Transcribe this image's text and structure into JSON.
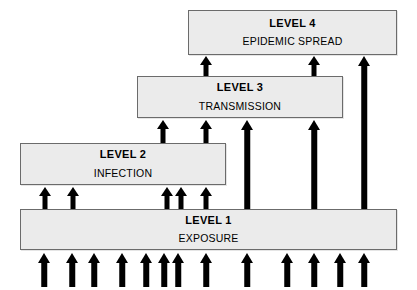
{
  "diagram": {
    "background_color": "#ffffff",
    "box_fill_color": "#ebebeb",
    "box_border_color": "#6b6b6b",
    "arrow_color": "#000000",
    "boxes": [
      {
        "id": "level-4",
        "title": "LEVEL 4",
        "subtitle": "EPIDEMIC SPREAD",
        "x": 188,
        "y": 10,
        "width": 209,
        "height": 45
      },
      {
        "id": "level-3",
        "title": "LEVEL 3",
        "subtitle": "TRANSMISSION",
        "x": 137,
        "y": 76,
        "width": 206,
        "height": 42
      },
      {
        "id": "level-2",
        "title": "LEVEL 2",
        "subtitle": "INFECTION",
        "x": 20,
        "y": 143,
        "width": 206,
        "height": 42
      },
      {
        "id": "level-1",
        "title": "LEVEL 1",
        "subtitle": "EXPOSURE",
        "x": 20,
        "y": 209,
        "width": 377,
        "height": 41
      }
    ],
    "arrows": [
      {
        "id": "a-l3-to-l4-1",
        "group": "level-3-to-level-4",
        "x": 206,
        "top": 56,
        "bottom": 76,
        "shaft_width": 5,
        "head_width": 13,
        "head_height": 9
      },
      {
        "id": "a-l3-to-l4-2",
        "group": "level-3-to-level-4",
        "x": 314,
        "top": 56,
        "bottom": 76,
        "shaft_width": 5,
        "head_width": 13,
        "head_height": 9
      },
      {
        "id": "a-l1-to-l4-1",
        "group": "level-1-to-level-4",
        "x": 364,
        "top": 56,
        "bottom": 209,
        "shaft_width": 5.5,
        "head_width": 13.5,
        "head_height": 10
      },
      {
        "id": "a-l2-to-l3-1",
        "group": "level-2-to-level-3",
        "x": 163,
        "top": 120,
        "bottom": 143,
        "shaft_width": 5,
        "head_width": 13,
        "head_height": 9
      },
      {
        "id": "a-l2-to-l3-2",
        "group": "level-2-to-level-3",
        "x": 206,
        "top": 120,
        "bottom": 143,
        "shaft_width": 5,
        "head_width": 13,
        "head_height": 9
      },
      {
        "id": "a-l1-to-l3-1",
        "group": "level-1-to-level-3",
        "x": 247,
        "top": 120,
        "bottom": 209,
        "shaft_width": 5.5,
        "head_width": 13.5,
        "head_height": 10
      },
      {
        "id": "a-l1-to-l3-2",
        "group": "level-1-to-level-3",
        "x": 314,
        "top": 120,
        "bottom": 209,
        "shaft_width": 5.5,
        "head_width": 13.5,
        "head_height": 10
      },
      {
        "id": "a-l1-to-l2-1",
        "group": "level-1-to-level-2",
        "x": 45,
        "top": 187,
        "bottom": 209,
        "shaft_width": 5,
        "head_width": 13,
        "head_height": 9
      },
      {
        "id": "a-l1-to-l2-2",
        "group": "level-1-to-level-2",
        "x": 73,
        "top": 187,
        "bottom": 209,
        "shaft_width": 5,
        "head_width": 13,
        "head_height": 9
      },
      {
        "id": "a-l1-to-l2-3",
        "group": "level-1-to-level-2",
        "x": 167,
        "top": 187,
        "bottom": 209,
        "shaft_width": 5,
        "head_width": 13,
        "head_height": 9
      },
      {
        "id": "a-l1-to-l2-4",
        "group": "level-1-to-level-2",
        "x": 181,
        "top": 187,
        "bottom": 209,
        "shaft_width": 5,
        "head_width": 13,
        "head_height": 9
      },
      {
        "id": "a-l1-to-l2-5",
        "group": "level-1-to-level-2",
        "x": 206,
        "top": 187,
        "bottom": 209,
        "shaft_width": 5,
        "head_width": 13,
        "head_height": 9
      },
      {
        "id": "a-source-1",
        "group": "source-to-level-1",
        "x": 44,
        "top": 253,
        "bottom": 287,
        "shaft_width": 5.5,
        "head_width": 13.5,
        "head_height": 10
      },
      {
        "id": "a-source-2",
        "group": "source-to-level-1",
        "x": 72,
        "top": 253,
        "bottom": 287,
        "shaft_width": 5.5,
        "head_width": 13.5,
        "head_height": 10
      },
      {
        "id": "a-source-3",
        "group": "source-to-level-1",
        "x": 94,
        "top": 253,
        "bottom": 287,
        "shaft_width": 5.5,
        "head_width": 13.5,
        "head_height": 10
      },
      {
        "id": "a-source-4",
        "group": "source-to-level-1",
        "x": 122,
        "top": 253,
        "bottom": 287,
        "shaft_width": 5.5,
        "head_width": 13.5,
        "head_height": 10
      },
      {
        "id": "a-source-5",
        "group": "source-to-level-1",
        "x": 146,
        "top": 253,
        "bottom": 287,
        "shaft_width": 5.5,
        "head_width": 13.5,
        "head_height": 10
      },
      {
        "id": "a-source-6",
        "group": "source-to-level-1",
        "x": 164,
        "top": 253,
        "bottom": 287,
        "shaft_width": 5.5,
        "head_width": 13.5,
        "head_height": 10
      },
      {
        "id": "a-source-7",
        "group": "source-to-level-1",
        "x": 178,
        "top": 253,
        "bottom": 287,
        "shaft_width": 5.5,
        "head_width": 13.5,
        "head_height": 10
      },
      {
        "id": "a-source-8",
        "group": "source-to-level-1",
        "x": 206,
        "top": 253,
        "bottom": 287,
        "shaft_width": 5.5,
        "head_width": 13.5,
        "head_height": 10
      },
      {
        "id": "a-source-9",
        "group": "source-to-level-1",
        "x": 247,
        "top": 253,
        "bottom": 287,
        "shaft_width": 5.5,
        "head_width": 13.5,
        "head_height": 10
      },
      {
        "id": "a-source-10",
        "group": "source-to-level-1",
        "x": 287,
        "top": 253,
        "bottom": 287,
        "shaft_width": 5.5,
        "head_width": 13.5,
        "head_height": 10
      },
      {
        "id": "a-source-11",
        "group": "source-to-level-1",
        "x": 314,
        "top": 253,
        "bottom": 287,
        "shaft_width": 5.5,
        "head_width": 13.5,
        "head_height": 10
      },
      {
        "id": "a-source-12",
        "group": "source-to-level-1",
        "x": 340,
        "top": 253,
        "bottom": 287,
        "shaft_width": 5.5,
        "head_width": 13.5,
        "head_height": 10
      },
      {
        "id": "a-source-13",
        "group": "source-to-level-1",
        "x": 364,
        "top": 253,
        "bottom": 287,
        "shaft_width": 5.5,
        "head_width": 13.5,
        "head_height": 10
      }
    ]
  }
}
